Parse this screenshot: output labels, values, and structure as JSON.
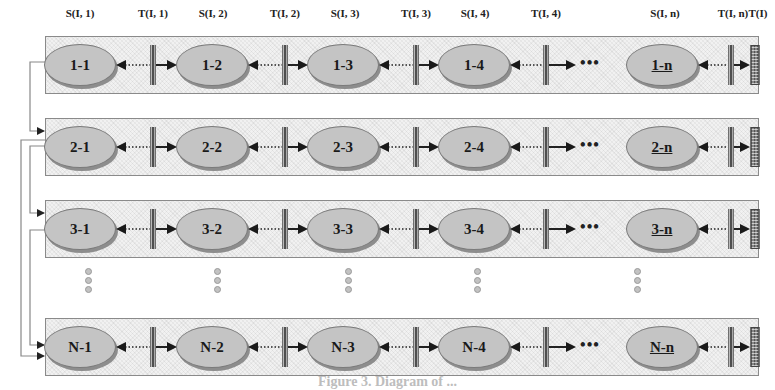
{
  "column_labels": [
    {
      "id": "s1",
      "text": "S(I, 1)",
      "x": 80
    },
    {
      "id": "t1",
      "text": "T(I, 1)",
      "x": 153
    },
    {
      "id": "s2",
      "text": "S(I, 2)",
      "x": 213
    },
    {
      "id": "t2",
      "text": "T(I, 2)",
      "x": 285
    },
    {
      "id": "s3",
      "text": "S(I, 3)",
      "x": 345
    },
    {
      "id": "t3",
      "text": "T(I, 3)",
      "x": 416
    },
    {
      "id": "s4",
      "text": "S(I, 4)",
      "x": 475
    },
    {
      "id": "t4",
      "text": "T(I, 4)",
      "x": 546
    },
    {
      "id": "sn",
      "text": "S(I, n)",
      "x": 665
    },
    {
      "id": "tn",
      "text": "T(I, n)",
      "x": 733
    },
    {
      "id": "ti",
      "text": "T(I)",
      "x": 758
    }
  ],
  "rows": [
    {
      "id": "row-1",
      "nodes": [
        "1-1",
        "1-2",
        "1-3",
        "1-4",
        "1-n"
      ]
    },
    {
      "id": "row-2",
      "nodes": [
        "2-1",
        "2-2",
        "2-3",
        "2-4",
        "2-n"
      ]
    },
    {
      "id": "row-3",
      "nodes": [
        "3-1",
        "3-2",
        "3-3",
        "3-4",
        "3-n"
      ]
    },
    {
      "id": "row-N",
      "nodes": [
        "N-1",
        "N-2",
        "N-3",
        "N-4",
        "N-n"
      ]
    }
  ],
  "ellipsis_symbol": "•••",
  "caption": "Figure 3. Diagram of ..."
}
